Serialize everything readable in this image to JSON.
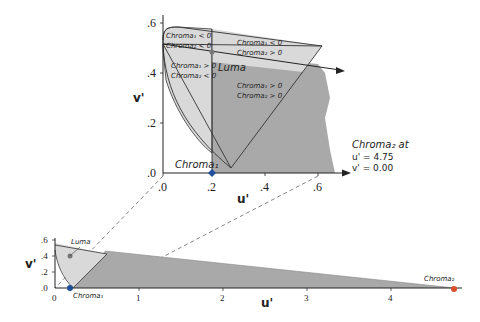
{
  "colors": {
    "light_region": "#d9d9d9",
    "dark_region": "#a9a9a9",
    "outline": "#333333",
    "chroma1_point": "#1f4e9a",
    "chroma2_point": "#d9502a",
    "dashed": "#666666"
  },
  "top_chart": {
    "xlabel": "u'",
    "ylabel": "v'",
    "x_ticks": [
      ".0",
      ".2",
      ".4",
      ".6"
    ],
    "y_ticks": [
      ".0",
      ".2",
      ".4",
      ".6"
    ],
    "regions": [
      {
        "line1": "Chroma₁ < 0",
        "line2": "Chroma₂ < 0"
      },
      {
        "line1": "Chroma₁ < 0",
        "line2": "Chroma₂ > 0"
      },
      {
        "line1": "Chroma₁ > 0",
        "line2": "Chroma₂ < 0"
      },
      {
        "line1": "Chroma₁ > 0",
        "line2": "Chroma₂ > 0"
      }
    ],
    "luma_label": "Luma",
    "chroma1_label": "Chroma₁",
    "chroma2_note": {
      "line1": "Chroma₂ at",
      "line2": "u' = 4.75",
      "line3": "v' = 0.00"
    }
  },
  "bottom_chart": {
    "xlabel": "u'",
    "ylabel": "v'",
    "x_ticks": [
      "0",
      "1",
      "2",
      "3",
      "4"
    ],
    "y_ticks": [
      ".0",
      ".2",
      ".4",
      ".6"
    ],
    "luma_label": "Luma",
    "chroma1_label": "Chroma₁",
    "chroma2_label": "Chroma₂"
  }
}
